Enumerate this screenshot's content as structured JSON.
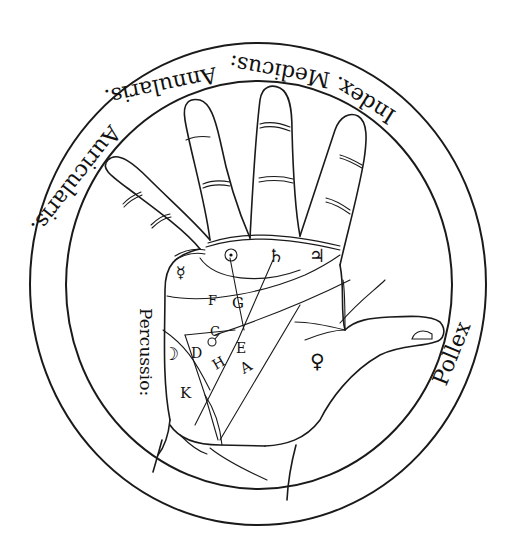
{
  "figure": {
    "ink_color": "#1a1a1a",
    "background": "#ffffff"
  },
  "ring_labels": {
    "index": "Index.",
    "medicus": "Medicus:",
    "annularis": "Annularis.",
    "auricularis": "Auricularis.",
    "percussio": "Percussio:",
    "pollex": "Pollex"
  },
  "palm_letters": {
    "F": "F",
    "G": "G",
    "C": "C",
    "D": "D",
    "H": "H",
    "E": "E",
    "A": "A",
    "K": "K"
  },
  "planet_symbols": {
    "sun": "☉",
    "saturn": "♄",
    "jupiter": "♃",
    "mercury": "☿",
    "venus": "♀",
    "moon": "☽",
    "mars": "♂"
  }
}
